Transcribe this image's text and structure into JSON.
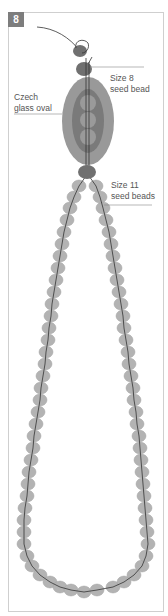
{
  "step_badge": "8",
  "labels": {
    "size8": [
      "Size 8",
      "seed bead"
    ],
    "czech": [
      "Czech",
      "glass oval"
    ],
    "size11": [
      "Size 11",
      "seed beads"
    ]
  },
  "colors": {
    "bead_fill": "#b3b3b3",
    "bead_stroke": "#a3a3a3",
    "dark_bead": "#707070",
    "oval_outer": "#999999",
    "oval_inner": "#7a7a7a",
    "oval_circles": "#9a9a9a",
    "thread": "#333333",
    "leader": "#888888",
    "frame": "#cfcfcf",
    "badge": "#7d7d7d"
  },
  "loop_left": [
    [
      79,
      186
    ],
    [
      74,
      197
    ],
    [
      70,
      208
    ],
    [
      67,
      220
    ],
    [
      64,
      232
    ],
    [
      62,
      244
    ],
    [
      60,
      256
    ],
    [
      58,
      268
    ],
    [
      56,
      280
    ],
    [
      54,
      292
    ],
    [
      52,
      304
    ],
    [
      51,
      316
    ],
    [
      49,
      328
    ],
    [
      48,
      340
    ],
    [
      46,
      352
    ],
    [
      45,
      364
    ],
    [
      43,
      376
    ],
    [
      41,
      388
    ],
    [
      40,
      400
    ],
    [
      38,
      412
    ],
    [
      36,
      424
    ],
    [
      34,
      436
    ],
    [
      33,
      448
    ],
    [
      31,
      460
    ],
    [
      29,
      472
    ],
    [
      28,
      484
    ],
    [
      27,
      496
    ],
    [
      25,
      508
    ],
    [
      24,
      520
    ],
    [
      24,
      532
    ],
    [
      24,
      544
    ],
    [
      27,
      556
    ],
    [
      32,
      566
    ],
    [
      40,
      575
    ],
    [
      50,
      582
    ],
    [
      60,
      587
    ],
    [
      71,
      590
    ]
  ],
  "loop_bottom": [
    [
      84,
      592
    ]
  ],
  "loop_right": [
    [
      96,
      186
    ],
    [
      100,
      197
    ],
    [
      103,
      208
    ],
    [
      106,
      220
    ],
    [
      109,
      232
    ],
    [
      111,
      244
    ],
    [
      113,
      256
    ],
    [
      115,
      268
    ],
    [
      117,
      280
    ],
    [
      119,
      292
    ],
    [
      121,
      304
    ],
    [
      123,
      316
    ],
    [
      124,
      328
    ],
    [
      126,
      340
    ],
    [
      128,
      352
    ],
    [
      129,
      364
    ],
    [
      131,
      376
    ],
    [
      133,
      388
    ],
    [
      134,
      400
    ],
    [
      136,
      412
    ],
    [
      137,
      424
    ],
    [
      139,
      436
    ],
    [
      140,
      448
    ],
    [
      141,
      460
    ],
    [
      142,
      472
    ],
    [
      143,
      484
    ],
    [
      144,
      496
    ],
    [
      145,
      508
    ],
    [
      146,
      520
    ],
    [
      147,
      532
    ],
    [
      148,
      544
    ],
    [
      146,
      556
    ],
    [
      142,
      566
    ],
    [
      134,
      575
    ],
    [
      124,
      582
    ],
    [
      113,
      587
    ],
    [
      97,
      590
    ]
  ]
}
